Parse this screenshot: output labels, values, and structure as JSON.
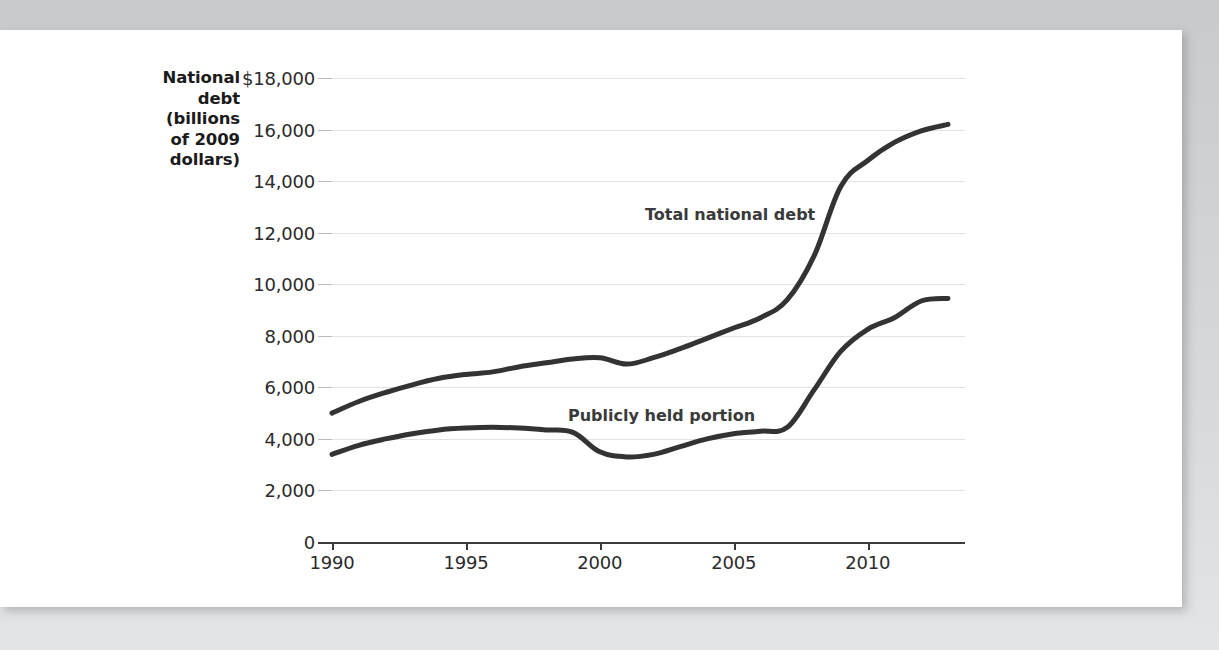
{
  "figure": {
    "y_axis_title_lines": [
      "National",
      "debt",
      "(billions",
      "of 2009",
      "dollars)"
    ],
    "series_labels": {
      "total": "Total national debt",
      "public": "Publicly held portion"
    }
  },
  "chart_data": {
    "type": "line",
    "title": "",
    "xlabel": "",
    "ylabel": "National debt (billions of 2009 dollars)",
    "xlim": [
      1990,
      2013
    ],
    "ylim": [
      0,
      18000
    ],
    "grid": true,
    "legend": "inline-annotations",
    "xticks": [
      "1990",
      "1995",
      "2000",
      "2005",
      "2010"
    ],
    "xtick_values": [
      1990,
      1995,
      2000,
      2005,
      2010
    ],
    "yticks": [
      "0",
      "2,000",
      "4,000",
      "6,000",
      "8,000",
      "10,000",
      "12,000",
      "14,000",
      "16,000",
      "$18,000"
    ],
    "ytick_values": [
      0,
      2000,
      4000,
      6000,
      8000,
      10000,
      12000,
      14000,
      16000,
      18000
    ],
    "x": [
      1990,
      1991,
      1992,
      1993,
      1994,
      1995,
      1996,
      1997,
      1998,
      1999,
      2000,
      2001,
      2002,
      2003,
      2004,
      2005,
      2006,
      2007,
      2008,
      2009,
      2010,
      2011,
      2012,
      2013
    ],
    "series": [
      {
        "name": "Total national debt",
        "values": [
          5000,
          5450,
          5800,
          6100,
          6350,
          6500,
          6600,
          6800,
          6950,
          7100,
          7150,
          6900,
          7150,
          7500,
          7900,
          8300,
          8700,
          9400,
          11100,
          13800,
          14800,
          15500,
          15950,
          16200
        ]
      },
      {
        "name": "Publicly held portion",
        "values": [
          3400,
          3750,
          4000,
          4200,
          4350,
          4420,
          4450,
          4420,
          4350,
          4250,
          3500,
          3300,
          3400,
          3700,
          4000,
          4200,
          4300,
          4450,
          5900,
          7400,
          8250,
          8700,
          9350,
          9450
        ]
      }
    ]
  }
}
